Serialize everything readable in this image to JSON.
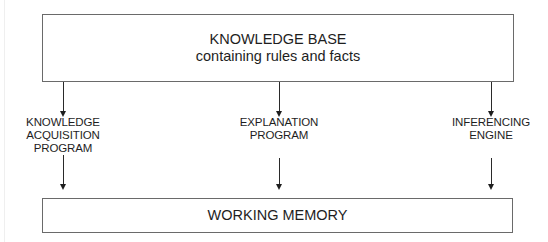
{
  "diagram": {
    "knowledge_base": {
      "title": "KNOWLEDGE BASE",
      "subtitle": "containing rules and facts"
    },
    "components": [
      {
        "label_lines": [
          "KNOWLEDGE",
          "ACQUISITION",
          "PROGRAM"
        ]
      },
      {
        "label_lines": [
          "EXPLANATION",
          "PROGRAM"
        ]
      },
      {
        "label_lines": [
          "INFERENCING",
          "ENGINE"
        ]
      }
    ],
    "working_memory": {
      "title": "WORKING MEMORY"
    },
    "colors": {
      "line": "#2a2a2a",
      "border": "#6a6a6a",
      "text": "#1e1e1e"
    }
  }
}
